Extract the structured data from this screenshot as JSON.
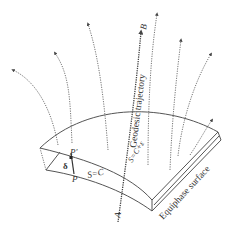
{
  "diagram": {
    "labels": {
      "point_b": "B",
      "point_a": "A",
      "point_p": "P",
      "point_p_prime": "P'",
      "delta": "δ",
      "inner_surface": "S=C",
      "outer_surface": "S=C+ε",
      "geodesic": "Geodesic trajectory",
      "equiphase": "Equiphase surface"
    },
    "colors": {
      "stroke": "#555555",
      "dotted": "#666666",
      "text": "#333333"
    }
  }
}
